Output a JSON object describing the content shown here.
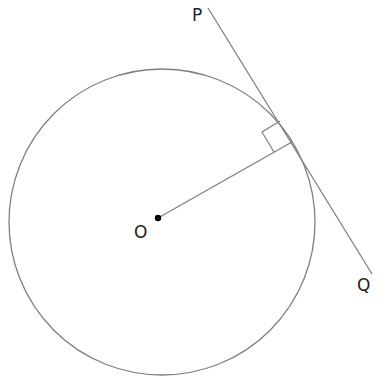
{
  "diagram": {
    "labels": {
      "center": "O",
      "tangent_start": "P",
      "tangent_end": "Q"
    },
    "colors": {
      "stroke": "#808080",
      "text": "#222222",
      "dot": "#000000"
    },
    "geometry": {
      "circle": {
        "cx": 162,
        "cy": 222,
        "r": 153
      },
      "center_point": {
        "x": 158,
        "y": 218
      },
      "tangent_point": {
        "x": 292,
        "y": 142
      },
      "tangent_line": {
        "x1": 208,
        "y1": 8,
        "x2": 372,
        "y2": 274
      },
      "right_angle_marker": true
    }
  }
}
